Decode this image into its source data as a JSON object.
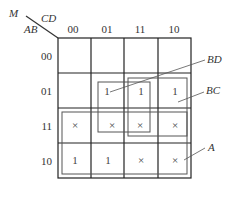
{
  "kmap": {
    "corner": {
      "var_m": "M",
      "col_vars": "CD",
      "row_vars": "AB"
    },
    "col_headers": [
      "00",
      "01",
      "11",
      "10"
    ],
    "row_headers": [
      "00",
      "01",
      "11",
      "10"
    ],
    "cells": [
      [
        "",
        "",
        "",
        ""
      ],
      [
        "",
        "1",
        "1",
        "1"
      ],
      [
        "×",
        "×",
        "×",
        "×"
      ],
      [
        "1",
        "1",
        "×",
        "×"
      ]
    ],
    "groups": [
      {
        "label": "BD",
        "cells": "rows 01-11, cols 01-11"
      },
      {
        "label": "BC",
        "cells": "rows 01-11, cols 11-10"
      },
      {
        "label": "A",
        "cells": "rows 11-10, all cols"
      }
    ],
    "group_labels": {
      "bd": "BD",
      "bc": "BC",
      "a": "A"
    }
  }
}
